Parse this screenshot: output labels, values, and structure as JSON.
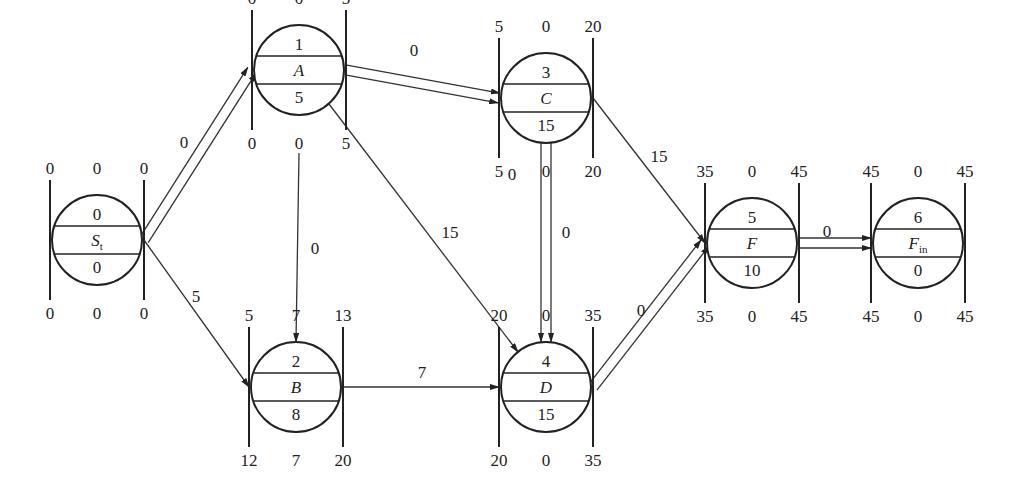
{
  "diagram": {
    "nodes": [
      {
        "id": "St",
        "cx": 97,
        "cy": 240,
        "label": "S",
        "sub": "t",
        "number": "0",
        "duration": "0",
        "es": "0",
        "tf": "0",
        "ef": "0",
        "ls": "0",
        "ff": "0",
        "lf": "0"
      },
      {
        "id": "A",
        "cx": 299,
        "cy": 70,
        "label": "A",
        "sub": "",
        "number": "1",
        "duration": "5",
        "es": "0",
        "tf": "0",
        "ef": "5",
        "ls": "0",
        "ff": "0",
        "lf": "5"
      },
      {
        "id": "B",
        "cx": 296,
        "cy": 387,
        "label": "B",
        "sub": "",
        "number": "2",
        "duration": "8",
        "es": "5",
        "tf": "7",
        "ef": "13",
        "ls": "12",
        "ff": "7",
        "lf": "20"
      },
      {
        "id": "C",
        "cx": 546,
        "cy": 98,
        "label": "C",
        "sub": "",
        "number": "3",
        "duration": "15",
        "es": "5",
        "tf": "0",
        "ef": "20",
        "ls": "5",
        "ff": "0",
        "lf": "20"
      },
      {
        "id": "D",
        "cx": 546,
        "cy": 387,
        "label": "D",
        "sub": "",
        "number": "4",
        "duration": "15",
        "es": "20",
        "tf": "0",
        "ef": "35",
        "ls": "20",
        "ff": "0",
        "lf": "35"
      },
      {
        "id": "F",
        "cx": 752,
        "cy": 243,
        "label": "F",
        "sub": "",
        "number": "5",
        "duration": "10",
        "es": "35",
        "tf": "0",
        "ef": "45",
        "ls": "35",
        "ff": "0",
        "lf": "45"
      },
      {
        "id": "Fin",
        "cx": 918,
        "cy": 243,
        "label": "F",
        "sub": "in",
        "number": "6",
        "duration": "0",
        "es": "45",
        "tf": "0",
        "ef": "45",
        "ls": "45",
        "ff": "0",
        "lf": "45"
      }
    ],
    "edges": [
      {
        "from": "St",
        "to": "A",
        "lag": "0",
        "critical": true
      },
      {
        "from": "St",
        "to": "B",
        "lag": "5",
        "critical": false
      },
      {
        "from": "A",
        "to": "C",
        "lag": "0",
        "critical": true
      },
      {
        "from": "A",
        "to": "B",
        "lag": "0",
        "critical": false
      },
      {
        "from": "A",
        "to": "D",
        "lag": "15",
        "critical": false
      },
      {
        "from": "C",
        "to": "D",
        "lag": "0",
        "critical": true
      },
      {
        "from": "C",
        "to": "F",
        "lag": "15",
        "critical": false
      },
      {
        "from": "B",
        "to": "D",
        "lag": "7",
        "critical": false
      },
      {
        "from": "D",
        "to": "F",
        "lag": "0",
        "critical": true
      },
      {
        "from": "F",
        "to": "Fin",
        "lag": "0",
        "critical": true
      }
    ],
    "extra_labels": [
      {
        "text": "0",
        "x": 512,
        "y": 180,
        "note": "left of C-D edge"
      }
    ]
  }
}
